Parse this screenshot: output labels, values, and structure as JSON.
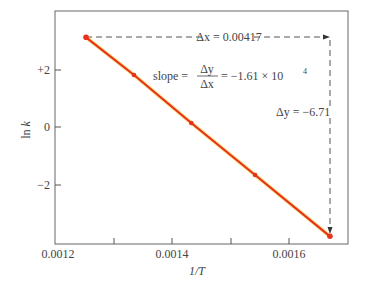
{
  "chart_data": {
    "type": "line",
    "title": "",
    "xlabel": "1/T",
    "ylabel": "ln k",
    "xlim": [
      0.0012,
      0.0017
    ],
    "ylim": [
      -4.1,
      4.0
    ],
    "x_ticks": [
      0.0012,
      0.0013,
      0.0014,
      0.0015,
      0.0016
    ],
    "x_tick_labels": [
      "0.0012",
      "",
      "0.0014",
      "",
      "0.0016"
    ],
    "y_ticks": [
      2,
      0,
      -2
    ],
    "y_tick_labels": [
      "+2",
      "0",
      "−2"
    ],
    "grid": false,
    "legend": null,
    "series": [
      {
        "name": "ln k vs 1/T",
        "color": "#e8321e",
        "x": [
          0.001253,
          0.001335,
          0.001433,
          0.001542,
          0.00167
        ],
        "y": [
          3.12,
          1.81,
          0.14,
          -1.67,
          -3.8
        ]
      }
    ],
    "annotations": {
      "delta_x": "Δx = 0.00417",
      "delta_y": "Δy = −6.71",
      "slope_prefix": "slope =",
      "slope_num": "Δy",
      "slope_den": "Δx",
      "slope_value": "= −1.61 × 10",
      "slope_exp": "4"
    }
  },
  "colors": {
    "line": "#e8321e",
    "line_glow": "#f7d23a",
    "axis": "#555555",
    "dash": "#444444"
  }
}
